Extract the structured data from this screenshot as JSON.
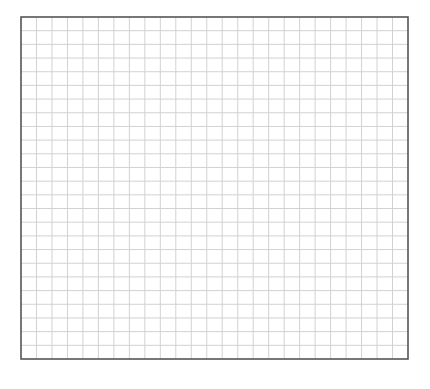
{
  "grid": {
    "columns": 25,
    "rows": 25,
    "line_color": "#d2d2d2",
    "border_color": "#555555",
    "background": "#ffffff"
  }
}
